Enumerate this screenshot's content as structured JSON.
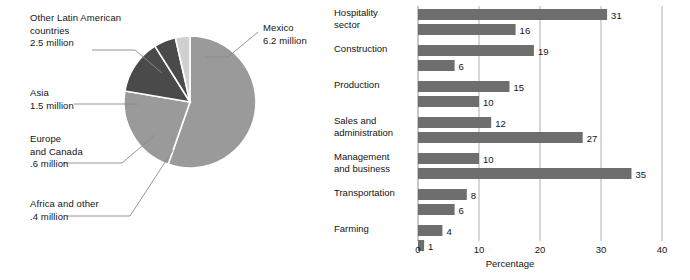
{
  "pie": {
    "title": "",
    "center": {
      "x": 190,
      "y": 102
    },
    "radius": 66,
    "unit": "million",
    "labels": {
      "other_latin": "Other Latin American\ncountries\n2.5 million",
      "asia": "Asia\n1.5 million",
      "europe_canada": "Europe\nand Canada\n.6 million",
      "africa_other": "Africa and other\n.4 million",
      "mexico": "Mexico\n6.2 million"
    }
  },
  "chart_data": [
    {
      "type": "pie",
      "title": "",
      "unit": "million",
      "total": 11.2,
      "slices": [
        {
          "name": "Mexico",
          "value": 6.2,
          "label": "Mexico\n6.2 million",
          "color": "#9a9a9a"
        },
        {
          "name": "Other Latin American countries",
          "value": 2.5,
          "label": "Other Latin American\ncountries\n2.5 million",
          "color": "#9a9a9a"
        },
        {
          "name": "Asia",
          "value": 1.5,
          "label": "Asia\n1.5 million",
          "color": "#4a4a4a"
        },
        {
          "name": "Europe and Canada",
          "value": 0.6,
          "label": "Europe\nand Canada\n.6 million",
          "color": "#4a4a4a"
        },
        {
          "name": "Africa and other",
          "value": 0.4,
          "label": "Africa and other\n.4 million",
          "color": "#d0d0d0"
        }
      ]
    },
    {
      "type": "bar",
      "orientation": "horizontal",
      "title": "",
      "xlabel": "Percentage",
      "ylabel": "",
      "xlim": [
        0,
        40
      ],
      "xticks": [
        0,
        10,
        20,
        30,
        40
      ],
      "xtick_labels": [
        "0",
        "10",
        "20",
        "30",
        "40"
      ],
      "grid": "vertical",
      "legend": "none",
      "categories": [
        "Hospitality\nsector",
        "Construction",
        "Production",
        "Sales and\nadministration",
        "Management\nand business",
        "Transportation",
        "Farming"
      ],
      "series": [
        {
          "name": "series-1",
          "values": [
            31,
            19,
            15,
            12,
            10,
            8,
            4
          ],
          "color": "#6e6e6e"
        },
        {
          "name": "series-2",
          "values": [
            16,
            6,
            10,
            27,
            35,
            6,
            1
          ],
          "color": "#6e6e6e"
        }
      ],
      "value_labels": [
        "31",
        "16",
        "19",
        "6",
        "15",
        "10",
        "12",
        "27",
        "10",
        "35",
        "8",
        "6",
        "4",
        "1"
      ]
    }
  ],
  "bar": {
    "axis_title": "Percentage",
    "ticks": [
      "0",
      "10",
      "20",
      "30",
      "40"
    ],
    "rows": [
      {
        "category": "Hospitality\nsector",
        "bars": [
          {
            "value": 31,
            "label": "31"
          },
          {
            "value": 16,
            "label": "16"
          }
        ]
      },
      {
        "category": "Construction",
        "bars": [
          {
            "value": 19,
            "label": "19"
          },
          {
            "value": 6,
            "label": "6"
          }
        ]
      },
      {
        "category": "Production",
        "bars": [
          {
            "value": 15,
            "label": "15"
          },
          {
            "value": 10,
            "label": "10"
          }
        ]
      },
      {
        "category": "Sales and\nadministration",
        "bars": [
          {
            "value": 12,
            "label": "12"
          },
          {
            "value": 27,
            "label": "27"
          }
        ]
      },
      {
        "category": "Management\nand business",
        "bars": [
          {
            "value": 10,
            "label": "10"
          },
          {
            "value": 35,
            "label": "35"
          }
        ]
      },
      {
        "category": "Transportation",
        "bars": [
          {
            "value": 8,
            "label": "8"
          },
          {
            "value": 6,
            "label": "6"
          }
        ]
      },
      {
        "category": "Farming",
        "bars": [
          {
            "value": 4,
            "label": "4"
          },
          {
            "value": 1,
            "label": "1"
          }
        ]
      }
    ]
  },
  "colors": {
    "bar_fill": "#6e6e6e",
    "pie_light": "#9a9a9a",
    "pie_dark": "#4a4a4a",
    "pie_pale": "#d0d0d0",
    "axis": "#9a9a9a",
    "text": "#141414",
    "leader": "#8a8a8a"
  }
}
